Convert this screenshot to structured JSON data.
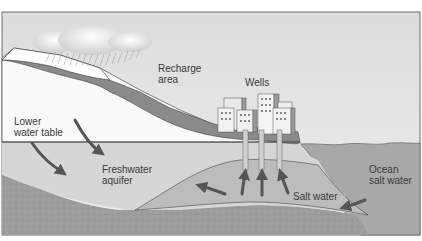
{
  "diagram": {
    "colors": {
      "sky": "#e4e4e4",
      "land_light": "#fafafa",
      "land_dark": "#8c8c8c",
      "aquifer": "#d8d8d8",
      "bedrock": "#9e9e9e",
      "ocean": "#a9a9a9",
      "salt_wedge": "#bdbdbd",
      "arrow": "#555555",
      "frame": "#6e6e6e"
    },
    "labels": {
      "recharge": "Recharge\narea",
      "wells": "Wells",
      "lower_water_table": "Lower\nwater table",
      "freshwater_aquifer": "Freshwater\naquifer",
      "ocean_salt_water": "Ocean\nsalt water",
      "salt_water": "Salt water"
    },
    "icons": [
      "rain-cloud-icon",
      "city-buildings-icon",
      "well-pipe-icon",
      "flow-arrow-icon"
    ],
    "wells_count": 3,
    "flow_arrows": [
      {
        "name": "lower-water-table-arrow-1",
        "direction": "down-right"
      },
      {
        "name": "lower-water-table-arrow-2",
        "direction": "down-right"
      },
      {
        "name": "salt-intrusion-arrow-left",
        "direction": "up-left"
      },
      {
        "name": "well-draw-arrow-1",
        "direction": "up"
      },
      {
        "name": "well-draw-arrow-2",
        "direction": "up"
      },
      {
        "name": "well-draw-arrow-3",
        "direction": "up"
      },
      {
        "name": "ocean-intrusion-arrow",
        "direction": "left"
      }
    ]
  }
}
